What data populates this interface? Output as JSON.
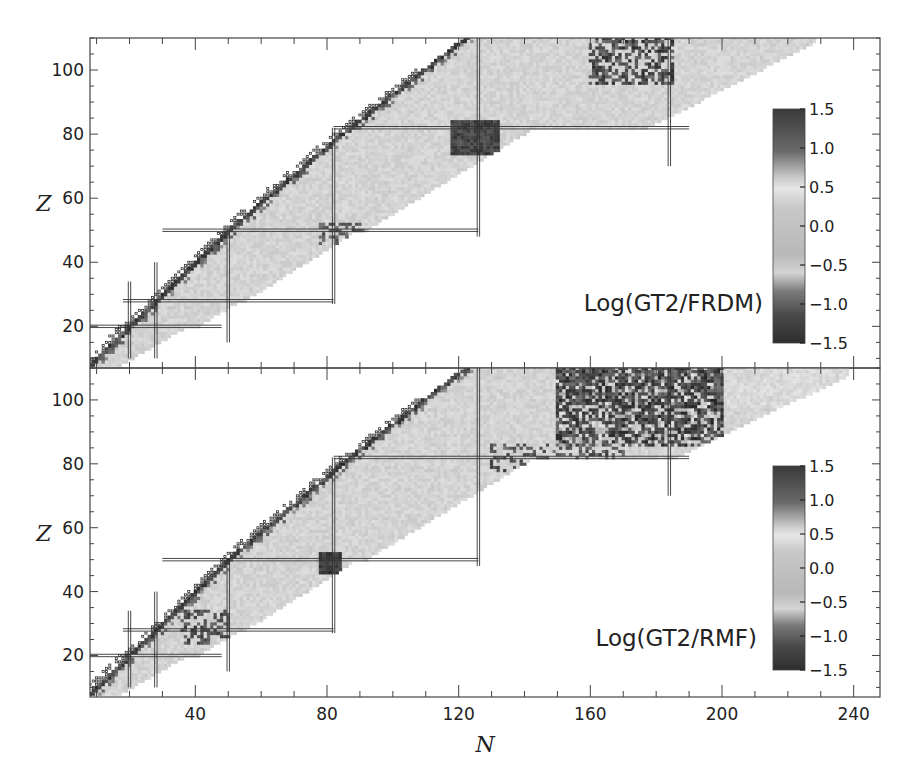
{
  "figure": {
    "x_axis": {
      "label": "N",
      "ticks": [
        40,
        80,
        120,
        160,
        200,
        240
      ],
      "range": [
        8,
        248
      ]
    },
    "panels": [
      {
        "id": "top",
        "annotation": "Log(GT2/FRDM)",
        "y_axis": {
          "label": "Z",
          "ticks": [
            20,
            40,
            60,
            80,
            100
          ],
          "range": [
            7,
            110
          ]
        },
        "colorbar": {
          "ticks": [
            "1.5",
            "1.0",
            "0.5",
            "0.0",
            "−0.5",
            "−1.0",
            "−1.5"
          ],
          "range": [
            -1.5,
            1.5
          ]
        }
      },
      {
        "id": "bottom",
        "annotation": "Log(GT2/RMF)",
        "y_axis": {
          "label": "Z",
          "ticks": [
            20,
            40,
            60,
            80,
            100
          ],
          "range": [
            7,
            110
          ]
        },
        "colorbar": {
          "ticks": [
            "1.5",
            "1.0",
            "0.5",
            "0.0",
            "−0.5",
            "−1.0",
            "−1.5"
          ],
          "range": [
            -1.5,
            1.5
          ]
        }
      }
    ],
    "magic_numbers": [
      20,
      28,
      50,
      82,
      126,
      184
    ]
  },
  "chart_data": [
    {
      "type": "heatmap",
      "title": "Log(GT2/FRDM)",
      "xlabel": "N",
      "ylabel": "Z",
      "xlim": [
        8,
        248
      ],
      "ylim": [
        7,
        110
      ],
      "xticks": [
        40,
        80,
        120,
        160,
        200,
        240
      ],
      "yticks": [
        20,
        40,
        60,
        80,
        100
      ],
      "colorbar": {
        "min": -1.5,
        "max": 1.5,
        "ticks": [
          1.5,
          1.0,
          0.5,
          0.0,
          -0.5,
          -1.0,
          -1.5
        ],
        "colormap": "grayscale (dark at extremes, light near 0.5)"
      },
      "magic_number_lines": {
        "N": [
          20,
          28,
          50,
          82,
          126,
          184
        ],
        "Z": [
          20,
          28,
          50,
          82
        ]
      },
      "notes": "Mostly light gray (~0.0–0.3) across the nuclear chart band; dark values cluster near the neutron-deficient edge, around N=126/Z=82, and at N≈170–185, Z>95. Open squares mark stable/known nuclei along the valley."
    },
    {
      "type": "heatmap",
      "title": "Log(GT2/RMF)",
      "xlabel": "N",
      "ylabel": "Z",
      "xlim": [
        8,
        248
      ],
      "ylim": [
        7,
        110
      ],
      "xticks": [
        40,
        80,
        120,
        160,
        200,
        240
      ],
      "yticks": [
        20,
        40,
        60,
        80,
        100
      ],
      "colorbar": {
        "min": -1.5,
        "max": 1.5,
        "ticks": [
          1.5,
          1.0,
          0.5,
          0.0,
          -0.5,
          -1.0,
          -1.5
        ],
        "colormap": "grayscale (dark at extremes, light near 0.5)"
      },
      "magic_number_lines": {
        "N": [
          20,
          28,
          50,
          82,
          126,
          184
        ],
        "Z": [
          20,
          28,
          50,
          82
        ]
      },
      "notes": "Light gray over most of the band; strong dark deviations for Z>80, N≈130–200 (heavy region), and around N=82/Z=50. The band extends to N≈235 at Z≈105."
    }
  ]
}
